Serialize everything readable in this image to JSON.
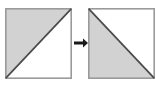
{
  "figure": {
    "type": "geometry-diagram",
    "canvas": {
      "width": 156,
      "height": 88,
      "background": "#ffffff"
    },
    "palette": {
      "shade_fill": "#d2d2d2",
      "white_fill": "#ffffff",
      "square_border": "#9a9a9a",
      "diagonal_line": "#4a4a4a",
      "arrow_color": "#1a1a1a"
    },
    "shapes": [
      {
        "name": "left-square",
        "label": "Square 1",
        "x": 5,
        "y": 8,
        "width": 67,
        "height": 71,
        "diagonal": "bottom-left-to-top-right",
        "shaded_triangle": "upper-left",
        "white_triangle": "lower-right",
        "shaded_vertices": "top-left, top-right, bottom-left",
        "white_vertices": "top-right, bottom-right, bottom-left"
      },
      {
        "name": "right-square",
        "label": "Square 2",
        "x": 88,
        "y": 8,
        "width": 67,
        "height": 71,
        "diagonal": "top-left-to-bottom-right",
        "shaded_triangle": "lower-left",
        "white_triangle": "upper-right",
        "shaded_vertices": "top-left, bottom-left, bottom-right",
        "white_vertices": "top-left, top-right, bottom-right"
      }
    ],
    "arrow": {
      "name": "transform-arrow",
      "label": "transforms to",
      "direction": "right",
      "shaft_x1": 74,
      "shaft_x2": 83,
      "tip_x": 88,
      "center_y": 43,
      "shaft_thickness": 3,
      "head_height": 9
    }
  }
}
